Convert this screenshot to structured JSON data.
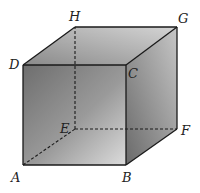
{
  "diagram": {
    "type": "cube",
    "vertices": {
      "A": {
        "label": "A",
        "x": 23,
        "y": 165
      },
      "B": {
        "label": "B",
        "x": 126,
        "y": 165
      },
      "C": {
        "label": "C",
        "x": 126,
        "y": 65
      },
      "D": {
        "label": "D",
        "x": 23,
        "y": 65
      },
      "E": {
        "label": "E",
        "x": 75,
        "y": 129
      },
      "F": {
        "label": "F",
        "x": 177,
        "y": 129
      },
      "G": {
        "label": "G",
        "x": 177,
        "y": 27
      },
      "H": {
        "label": "H",
        "x": 75,
        "y": 27
      }
    },
    "visible_edges": [
      "AB",
      "BC",
      "CD",
      "DA",
      "DH",
      "HG",
      "GC",
      "GF",
      "FB"
    ],
    "hidden_edges": [
      "AE",
      "EF",
      "EH"
    ],
    "colors": {
      "front_face_dark": "#6e6e6e",
      "front_face_light": "#d8d8d8",
      "top_face_dark": "#8a8a8a",
      "top_face_light": "#d0d0d0",
      "side_face_dark": "#6a6a6a",
      "side_face_light": "#c8c8c8",
      "edge": "#1a1a1a"
    }
  }
}
